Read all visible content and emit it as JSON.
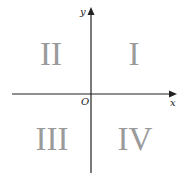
{
  "diagram": {
    "axes": {
      "x_label": "x",
      "y_label": "y",
      "origin_label": "O"
    },
    "quadrants": [
      {
        "id": "I",
        "label": "I",
        "position": "upper-right"
      },
      {
        "id": "II",
        "label": "II",
        "position": "upper-left"
      },
      {
        "id": "III",
        "label": "III",
        "position": "lower-left"
      },
      {
        "id": "IV",
        "label": "IV",
        "position": "lower-right"
      }
    ],
    "colors": {
      "axis": "#222222",
      "quadrant_text": "#9a9a9a",
      "background": "#ffffff"
    }
  }
}
